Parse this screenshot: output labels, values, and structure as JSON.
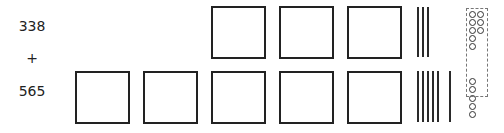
{
  "problem": {
    "addend1": "338",
    "operator": "+",
    "addend2": "565"
  },
  "blocks": {
    "top": {
      "hundreds": 3,
      "tens": 3,
      "ones": 8
    },
    "bottom": {
      "hundreds": 5,
      "tens": 6,
      "ones": 5
    },
    "regroup_ones": 10
  }
}
